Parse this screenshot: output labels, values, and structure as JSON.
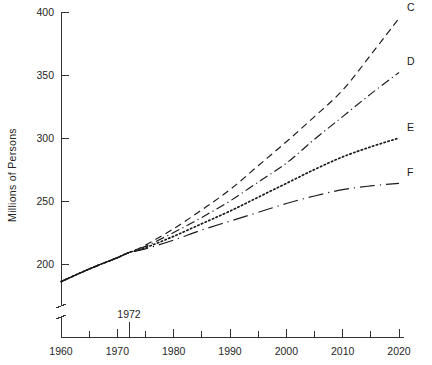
{
  "chart_data": {
    "type": "line",
    "title": "",
    "subtitle": "",
    "xlabel": "",
    "ylabel": "Millions of  Persons",
    "xlim": [
      1960,
      2020
    ],
    "ylim": [
      180,
      400
    ],
    "grid": false,
    "legend_position": "right-end-of-line labels",
    "axis_break": true,
    "axis_break_note": "y-axis broken below 190",
    "x_ticks_major": [
      1960,
      1970,
      1980,
      1990,
      2000,
      2010,
      2020
    ],
    "x_ticks_minor": [
      1965,
      1975,
      1985,
      1995,
      2005,
      2015
    ],
    "x_tick_labels": [
      "1960",
      "1970",
      "1980",
      "1990",
      "2000",
      "2010",
      "2020"
    ],
    "y_ticks": [
      200,
      250,
      300,
      350,
      400
    ],
    "y_tick_labels": [
      "200",
      "250",
      "300",
      "350",
      "400"
    ],
    "annotations": [
      {
        "text": "1972",
        "x": 1972,
        "kind": "x-axis-callout"
      }
    ],
    "series": [
      {
        "name": "C",
        "label": "C",
        "style": "dashed",
        "x": [
          1960,
          1965,
          1970,
          1972,
          1975,
          1980,
          1985,
          1990,
          1995,
          2000,
          2005,
          2010,
          2015,
          2020
        ],
        "values": [
          186,
          196,
          205,
          209,
          215,
          228,
          243,
          259,
          278,
          297,
          317,
          338,
          366,
          395
        ]
      },
      {
        "name": "D",
        "label": "D",
        "style": "dashdot",
        "x": [
          1960,
          1965,
          1970,
          1972,
          1975,
          1980,
          1985,
          1990,
          1995,
          2000,
          2005,
          2010,
          2015,
          2020
        ],
        "values": [
          186,
          196,
          205,
          209,
          214,
          225,
          237,
          250,
          265,
          280,
          299,
          317,
          335,
          352
        ]
      },
      {
        "name": "E",
        "label": "E",
        "style": "dotted",
        "x": [
          1960,
          1965,
          1970,
          1972,
          1975,
          1980,
          1985,
          1990,
          1995,
          2000,
          2005,
          2010,
          2015,
          2020
        ],
        "values": [
          186,
          196,
          205,
          209,
          213,
          222,
          232,
          242,
          253,
          264,
          275,
          285,
          293,
          300
        ]
      },
      {
        "name": "F",
        "label": "F",
        "style": "longdashdot",
        "x": [
          1960,
          1965,
          1970,
          1972,
          1975,
          1980,
          1985,
          1990,
          1995,
          2000,
          2005,
          2010,
          2015,
          2020
        ],
        "values": [
          186,
          196,
          205,
          209,
          212,
          219,
          227,
          234,
          241,
          248,
          254,
          259,
          262,
          264
        ]
      }
    ],
    "historical_segment": {
      "name": "historical",
      "style": "solid",
      "x": [
        1960,
        1965,
        1970,
        1972
      ],
      "values": [
        186,
        196,
        205,
        209
      ]
    }
  }
}
